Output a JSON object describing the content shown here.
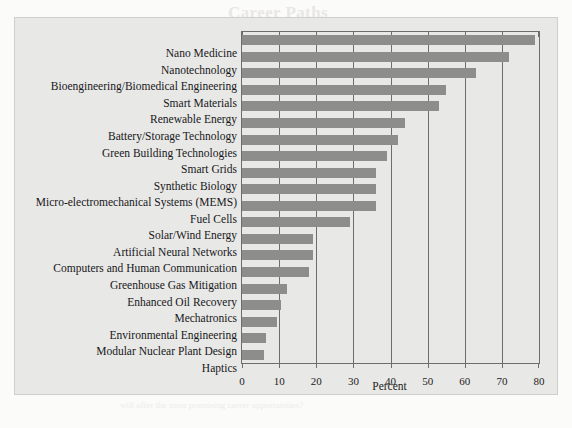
{
  "page": {
    "background_color": "#fbfbfa",
    "bleed_through": {
      "title": "Career Paths",
      "lines": [
        "In the near future, which of these areas do you believe",
        "will offer the most promising career opportunities?"
      ]
    }
  },
  "figure": {
    "panel_color": "#e8e8e6",
    "border_color": "#cfcfcc",
    "axis_color": "#6d6d6d",
    "bar_color": "#8d8d8b"
  },
  "chart_data": {
    "type": "bar",
    "orientation": "horizontal",
    "title": "",
    "subtitle": "",
    "xlabel": "Percent",
    "ylabel": "",
    "xlim": [
      0,
      80
    ],
    "ylim": [
      0,
      20
    ],
    "xticks": [
      0,
      10,
      20,
      30,
      40,
      50,
      60,
      70,
      80
    ],
    "xtick_labels": [
      "0",
      "10",
      "20",
      "30",
      "40",
      "50",
      "60",
      "70",
      "80"
    ],
    "grid": true,
    "grid_axis": "x",
    "legend": null,
    "legend_position": "none",
    "categories": [
      "Nano Medicine",
      "Nanotechnology",
      "Bioengineering/Biomedical Engineering",
      "Smart Materials",
      "Renewable Energy",
      "Battery/Storage Technology",
      "Green Building Technologies",
      "Smart Grids",
      "Synthetic Biology",
      "Micro-electromechanical Systems (MEMS)",
      "Fuel Cells",
      "Solar/Wind Energy",
      "Artificial Neural Networks",
      "Computers and Human Communication",
      "Greenhouse Gas Mitigation",
      "Enhanced Oil Recovery",
      "Mechatronics",
      "Environmental Engineering",
      "Modular Nuclear Plant Design",
      "Haptics"
    ],
    "values": [
      79,
      72,
      63,
      55,
      53,
      44,
      42,
      39,
      36,
      36,
      36,
      29,
      19,
      19,
      18,
      12,
      10.5,
      9.5,
      6.5,
      6
    ],
    "units": "percent"
  }
}
